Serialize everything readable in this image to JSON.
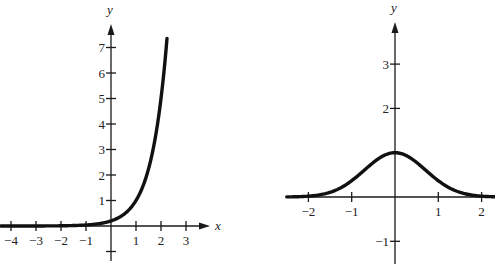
{
  "chart_data": [
    {
      "type": "line",
      "title": "",
      "function": "y = 0.2 * 5^x",
      "xlabel": "x",
      "ylabel": "y",
      "xlim": [
        -4.4,
        3.9
      ],
      "ylim": [
        -1.4,
        8.0
      ],
      "x_ticks": [
        -4,
        -3,
        -2,
        -1,
        1,
        2,
        3
      ],
      "x_tick_labels": [
        "−4",
        "−3",
        "−2",
        "−1",
        "1",
        "2",
        "3"
      ],
      "y_ticks": [
        1,
        2,
        3,
        4,
        5,
        6,
        7
      ],
      "y_tick_labels": [
        "1",
        "2",
        "3",
        "4",
        "5",
        "6",
        "7"
      ],
      "unlabeled_y_ticks": [
        -1
      ],
      "x_axis_arrow": true,
      "y_axis_arrow": true,
      "grid": false,
      "legend": null,
      "series": [
        {
          "name": "exponential growth",
          "x": [
            -4.4,
            -4,
            -3,
            -2,
            -1,
            -0.5,
            0,
            0.5,
            1,
            1.5,
            2,
            2.24
          ],
          "y": [
            0.0017,
            0.0032,
            0.0016,
            0.008,
            0.04,
            0.089,
            0.2,
            0.447,
            1.0,
            2.236,
            5.0,
            7.4
          ]
        }
      ],
      "frame": {
        "ox": 111,
        "oy": 226,
        "sx": 25,
        "sy": 25.5,
        "x_axis_from": 0,
        "x_axis_to": 210,
        "y_axis_from": 261,
        "y_axis_to": 24
      }
    },
    {
      "type": "line",
      "title": "",
      "function": "y = e^(-x^2)",
      "xlabel": "",
      "ylabel": "y",
      "xlim": [
        -2.5,
        2.3
      ],
      "ylim": [
        -1.5,
        4.0
      ],
      "x_ticks": [
        -2,
        -1,
        1,
        2
      ],
      "x_tick_labels": [
        "−2",
        "−1",
        "1",
        "2"
      ],
      "y_ticks": [
        3,
        2,
        -1
      ],
      "y_tick_labels": [
        "3",
        "2",
        "−1"
      ],
      "x_axis_arrow": false,
      "y_axis_arrow": true,
      "grid": false,
      "legend": null,
      "series": [
        {
          "name": "bell curve",
          "x": [
            -2.5,
            -2,
            -1.5,
            -1,
            -0.5,
            0,
            0.5,
            1,
            1.5,
            2,
            2.3
          ],
          "y": [
            0.002,
            0.018,
            0.105,
            0.368,
            0.779,
            1.0,
            0.779,
            0.368,
            0.105,
            0.018,
            0.005
          ]
        }
      ],
      "frame": {
        "ox": 395,
        "oy": 197,
        "sx": 43.3,
        "sy": 44.3,
        "x_axis_from": 287,
        "x_axis_to": 495,
        "y_axis_from": 264,
        "y_axis_to": 22
      }
    }
  ]
}
